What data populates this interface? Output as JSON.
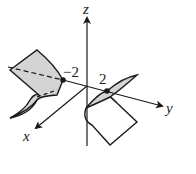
{
  "figure": {
    "axes": {
      "x_label": "x",
      "y_label": "y",
      "z_label": "z"
    },
    "points": [
      {
        "label": "−2",
        "axis": "y",
        "value": -2
      },
      {
        "label": "2",
        "axis": "y",
        "value": 2
      }
    ],
    "colors": {
      "line": "#1a1a1a",
      "surface_fill": "#d4d4d4",
      "background": "#ffffff"
    }
  }
}
